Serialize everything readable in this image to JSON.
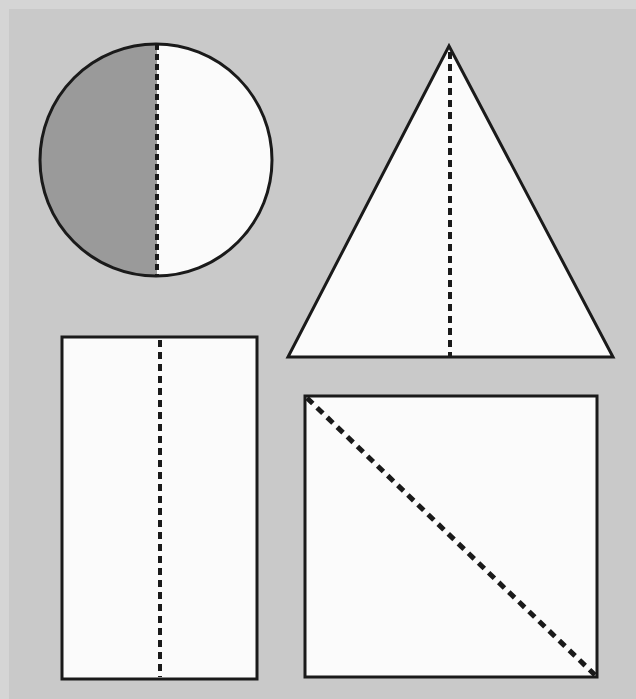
{
  "page": {
    "width": 636,
    "height": 699,
    "background_color": "#c9c9c9",
    "paper_edge_color": "#d5d5d5",
    "outline_color": "#1a1a1a",
    "dash_color": "#1a1a1a",
    "fill_white": "#fbfbfb",
    "fill_shaded": "#9a9a9a"
  },
  "shapes": [
    {
      "name": "circle",
      "label": "Circle with vertical line of symmetry",
      "type": "circle",
      "cx": 156,
      "cy": 160,
      "r": 116,
      "stroke_width": 3,
      "fill": "#fbfbfb",
      "shaded_half": "left",
      "shaded_fill": "#9a9a9a",
      "symmetry_line": {
        "orientation": "vertical",
        "x1": 157,
        "y1": 44,
        "x2": 157,
        "y2": 277,
        "dash": "6 4",
        "width": 4
      }
    },
    {
      "name": "triangle",
      "label": "Isosceles triangle with vertical line of symmetry",
      "type": "triangle",
      "points": "449,46 613,357 288,357",
      "apex_x": 449,
      "apex_y": 46,
      "base_left_x": 288,
      "base_right_x": 613,
      "base_y": 357,
      "stroke_width": 3,
      "fill": "#fbfbfb",
      "symmetry_line": {
        "orientation": "vertical",
        "x1": 450,
        "y1": 52,
        "x2": 450,
        "y2": 356,
        "dash": "7 5",
        "width": 4
      }
    },
    {
      "name": "rectangle",
      "label": "Rectangle with vertical line of symmetry",
      "type": "rectangle",
      "x": 62,
      "y": 337,
      "width": 195,
      "height": 342,
      "stroke_width": 3,
      "fill": "#fbfbfb",
      "symmetry_line": {
        "orientation": "vertical",
        "x1": 160,
        "y1": 340,
        "x2": 160,
        "y2": 677,
        "dash": "7 5",
        "width": 4
      }
    },
    {
      "name": "square",
      "label": "Square with diagonal line of symmetry",
      "type": "square",
      "x": 305,
      "y": 396,
      "width": 292,
      "height": 281,
      "stroke_width": 3,
      "fill": "#fbfbfb",
      "symmetry_line": {
        "orientation": "diagonal",
        "x1": 307,
        "y1": 398,
        "x2": 595,
        "y2": 675,
        "dash": "8 6",
        "width": 5
      }
    }
  ]
}
